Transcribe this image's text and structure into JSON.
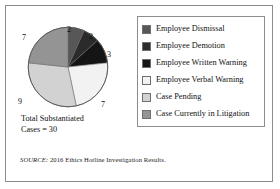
{
  "figure": {
    "caption_line1": "Total Substantiated",
    "caption_line2": "Cases = 30",
    "source_prefix": "SOURCE:",
    "source_text": " 2016 Ethics Hotline Investigation Results."
  },
  "legend": {
    "items": [
      {
        "label": "Employee Dismissal",
        "color": "#575757"
      },
      {
        "label": "Employee Demotion",
        "color": "#2b2b2b"
      },
      {
        "label": "Employee Written Warning",
        "color": "#151515"
      },
      {
        "label": "Employee Verbal Warning",
        "color": "#f2f2f2"
      },
      {
        "label": "Case Pending",
        "color": "#d2d2d2"
      },
      {
        "label": "Case Currently in Litigation",
        "color": "#949494"
      }
    ]
  },
  "chart_data": {
    "type": "pie",
    "title": "",
    "total": 30,
    "total_label": "Total Substantiated Cases = 30",
    "start_angle_deg": 0,
    "direction": "clockwise",
    "categories": [
      "Employee Dismissal",
      "Employee Demotion",
      "Employee Written Warning",
      "Employee Verbal Warning",
      "Case Pending",
      "Case Currently in Litigation"
    ],
    "values": [
      2,
      2,
      3,
      7,
      9,
      7
    ],
    "colors": [
      "#575757",
      "#2b2b2b",
      "#151515",
      "#f2f2f2",
      "#d2d2d2",
      "#949494"
    ],
    "data_labels": [
      "2",
      "2",
      "3",
      "7",
      "9",
      "7"
    ],
    "legend_position": "right",
    "grid": false
  },
  "pie_labels": [
    {
      "text": "2",
      "left": 40,
      "top": 0
    },
    {
      "text": "2",
      "left": 62,
      "top": 7
    },
    {
      "text": "3",
      "left": 80,
      "top": 25
    },
    {
      "text": "7",
      "left": 74,
      "top": 75
    },
    {
      "text": "9",
      "left": -9,
      "top": 72
    },
    {
      "text": "7",
      "left": -5,
      "top": 8
    }
  ]
}
